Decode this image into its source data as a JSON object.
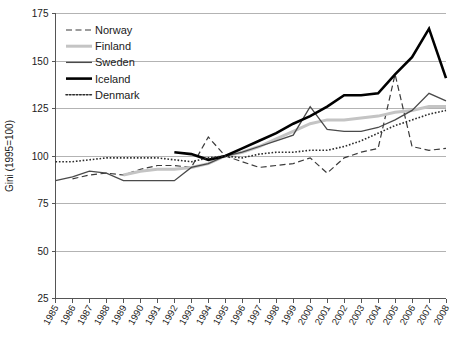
{
  "chart_data": {
    "type": "line",
    "title": "",
    "xlabel": "",
    "ylabel": "Gini (1995=100)",
    "xlim": [
      1985,
      2008
    ],
    "ylim": [
      25,
      175
    ],
    "yticks": [
      25,
      50,
      75,
      100,
      125,
      150,
      175
    ],
    "grid": true,
    "legend_position": "top-left",
    "x": [
      1985,
      1986,
      1987,
      1988,
      1989,
      1990,
      1991,
      1992,
      1993,
      1994,
      1995,
      1996,
      1997,
      1998,
      1999,
      2000,
      2001,
      2002,
      2003,
      2004,
      2005,
      2006,
      2007,
      2008
    ],
    "xtick_labels": [
      "1985",
      "1986",
      "1987",
      "1988",
      "1989",
      "1990",
      "1991",
      "1992",
      "1993",
      "1994",
      "1995",
      "1996",
      "1997",
      "1998",
      "1999",
      "2000",
      "2001",
      "2002",
      "2003",
      "2004",
      "2005",
      "2006",
      "2007",
      "2008"
    ],
    "series": [
      {
        "name": "Norway",
        "color": "#3a3a3a",
        "style": "dashed",
        "width": 1.2,
        "x": [
          1986,
          1987,
          1988,
          1989,
          1990,
          1991,
          1992,
          1993,
          1994,
          1995,
          1996,
          1997,
          1998,
          1999,
          2000,
          2001,
          2002,
          2003,
          2004,
          2005,
          2006,
          2007,
          2008
        ],
        "values": [
          88,
          90,
          91,
          90,
          93,
          95,
          95,
          94,
          110,
          100,
          97,
          94,
          95,
          96,
          99,
          91,
          99,
          102,
          104,
          143,
          105,
          103,
          104
        ]
      },
      {
        "name": "Finland",
        "color": "#c4c4c4",
        "style": "solid",
        "width": 3.0,
        "x": [
          1989,
          1990,
          1991,
          1992,
          1993,
          1994,
          1995,
          1996,
          1997,
          1998,
          1999,
          2000,
          2001,
          2002,
          2003,
          2004,
          2005,
          2006,
          2007,
          2008
        ],
        "values": [
          90,
          92,
          93,
          93,
          94,
          96,
          100,
          102,
          105,
          109,
          113,
          117,
          119,
          119,
          120,
          121,
          123,
          124,
          126,
          126
        ]
      },
      {
        "name": "Sweden",
        "color": "#4a4a4a",
        "style": "solid",
        "width": 1.3,
        "x": [
          1985,
          1986,
          1987,
          1988,
          1989,
          1990,
          1991,
          1992,
          1993,
          1994,
          1995,
          1996,
          1997,
          1998,
          1999,
          2000,
          2001,
          2002,
          2003,
          2004,
          2005,
          2006,
          2007,
          2008
        ],
        "values": [
          87,
          89,
          92,
          91,
          87,
          87,
          87,
          87,
          94,
          96,
          100,
          102,
          105,
          108,
          111,
          126,
          114,
          113,
          113,
          115,
          119,
          124,
          133,
          129
        ]
      },
      {
        "name": "Iceland",
        "color": "#000000",
        "style": "solid",
        "width": 2.6,
        "x": [
          1992,
          1993,
          1994,
          1995,
          1996,
          1997,
          1998,
          1999,
          2000,
          2001,
          2002,
          2003,
          2004,
          2005,
          2006,
          2007,
          2008
        ],
        "values": [
          102,
          101,
          98,
          100,
          104,
          108,
          112,
          117,
          121,
          126,
          132,
          132,
          133,
          143,
          152,
          167,
          141
        ]
      },
      {
        "name": "Denmark",
        "color": "#2b2b2b",
        "style": "dotted",
        "width": 1.6,
        "x": [
          1985,
          1986,
          1987,
          1988,
          1989,
          1990,
          1991,
          1992,
          1993,
          1994,
          1995,
          1996,
          1997,
          1998,
          1999,
          2000,
          2001,
          2002,
          2003,
          2004,
          2005,
          2006,
          2007,
          2008
        ],
        "values": [
          97,
          97,
          98,
          99,
          99,
          99,
          99,
          98,
          97,
          99,
          100,
          99,
          101,
          102,
          102,
          103,
          103,
          105,
          108,
          112,
          116,
          119,
          122,
          124
        ]
      }
    ]
  },
  "legend": {
    "items": [
      {
        "label": "Norway"
      },
      {
        "label": "Finland"
      },
      {
        "label": "Sweden"
      },
      {
        "label": "Iceland"
      },
      {
        "label": "Denmark"
      }
    ]
  }
}
